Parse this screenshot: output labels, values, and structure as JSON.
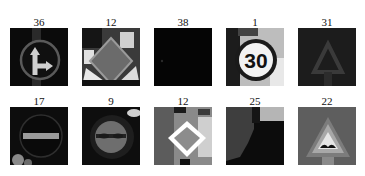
{
  "figure": {
    "rows": 2,
    "cols": 5,
    "colormap": "grayscale",
    "cells": [
      {
        "label": "36",
        "sign": "go-straight-or-right",
        "row": 0,
        "col": 0
      },
      {
        "label": "12",
        "sign": "priority-road-dark",
        "row": 0,
        "col": 1
      },
      {
        "label": "38",
        "sign": "near-black-image",
        "row": 0,
        "col": 2
      },
      {
        "label": "1",
        "sign": "speed-limit-30",
        "row": 0,
        "col": 3
      },
      {
        "label": "31",
        "sign": "dark-warning-triangle",
        "row": 0,
        "col": 4
      },
      {
        "label": "17",
        "sign": "no-entry",
        "row": 1,
        "col": 0
      },
      {
        "label": "9",
        "sign": "no-passing",
        "row": 1,
        "col": 1
      },
      {
        "label": "12",
        "sign": "priority-road",
        "row": 1,
        "col": 2
      },
      {
        "label": "25",
        "sign": "road-work-dark",
        "row": 1,
        "col": 3
      },
      {
        "label": "22",
        "sign": "bumpy-road",
        "row": 1,
        "col": 4
      }
    ]
  }
}
